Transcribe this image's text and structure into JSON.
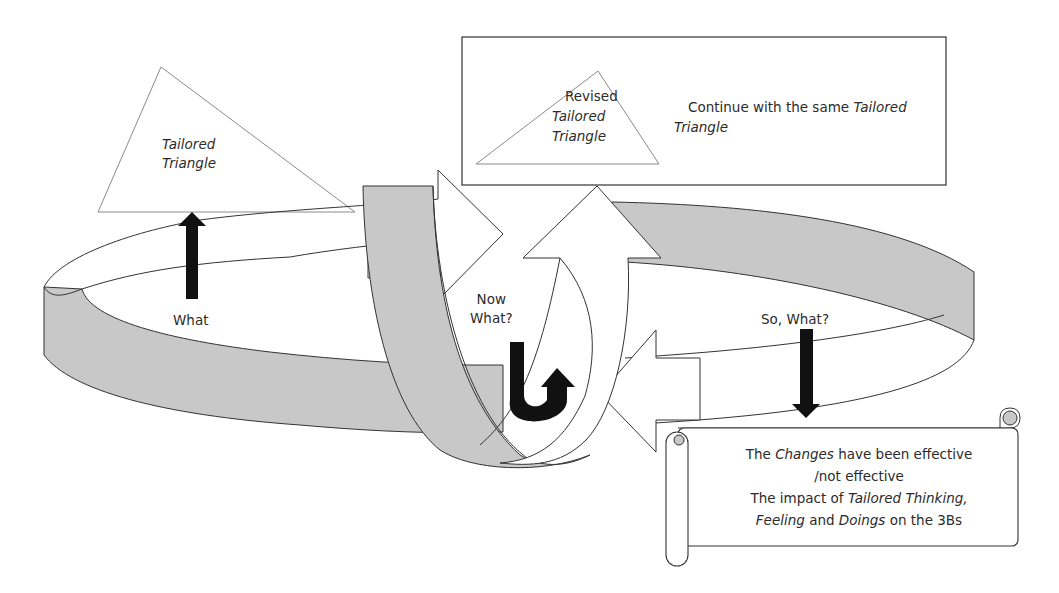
{
  "diagram": {
    "type": "reflective-cycle",
    "colors": {
      "ribbon_fill": "#c8c8c8",
      "outline": "#333333",
      "arrow_black": "#111111",
      "triangle_stroke": "#8a8a8a",
      "background": "#ffffff"
    },
    "top_left_triangle": {
      "line1": "Tailored",
      "line2": "Triangle"
    },
    "top_box": {
      "triangle": {
        "line1": "Revised",
        "line2": "Tailored",
        "line3": "Triangle"
      },
      "text_prefix": "Continue with the same ",
      "text_italic_1": "Tailored",
      "text_italic_2": "Triangle"
    },
    "stages": {
      "what": "What",
      "now_what_line1": "Now",
      "now_what_line2": "What?",
      "so_what": "So, What?"
    },
    "scroll": {
      "line1_a": "The ",
      "line1_b": "Changes",
      "line1_c": " have been effective",
      "line2": "/not effective",
      "line3_a": "The impact of  ",
      "line3_b": "Tailored Thinking,",
      "line4_a": "Feeling",
      "line4_b": " and ",
      "line4_c": "Doings",
      "line4_d": " on the 3Bs"
    }
  }
}
